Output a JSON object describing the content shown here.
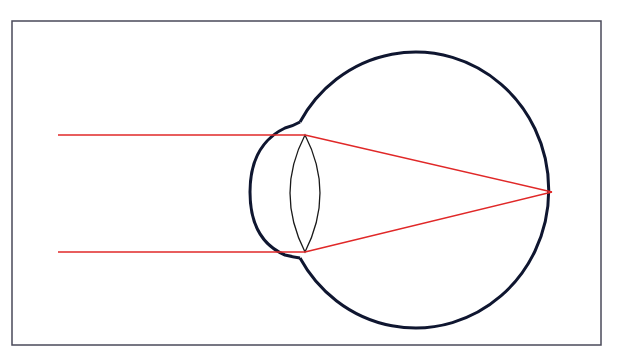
{
  "diagram": {
    "title": "",
    "colors": {
      "frame": "#4a4a5a",
      "eye_outline": "#0f1630",
      "lens": "#1a1a1a",
      "light_rays": "#e02828",
      "background": "#ffffff"
    },
    "elements": [
      {
        "name": "eyeball",
        "label": ""
      },
      {
        "name": "cornea",
        "label": ""
      },
      {
        "name": "lens",
        "label": ""
      },
      {
        "name": "incoming-ray-top",
        "label": ""
      },
      {
        "name": "incoming-ray-bottom",
        "label": ""
      },
      {
        "name": "refracted-ray-top",
        "label": ""
      },
      {
        "name": "refracted-ray-bottom",
        "label": ""
      },
      {
        "name": "focal-point",
        "label": ""
      }
    ]
  }
}
